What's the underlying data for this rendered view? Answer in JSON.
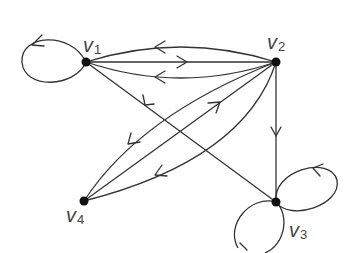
{
  "diagram": {
    "type": "directed multigraph",
    "nodes": [
      {
        "id": "v1",
        "label": "v",
        "subscript": "1"
      },
      {
        "id": "v2",
        "label": "v",
        "subscript": "2"
      },
      {
        "id": "v3",
        "label": "v",
        "subscript": "3"
      },
      {
        "id": "v4",
        "label": "v",
        "subscript": "4"
      }
    ],
    "edges": [
      {
        "id": "e1",
        "from": "v2",
        "to": "v1",
        "kind": "curve-upper"
      },
      {
        "id": "e2",
        "from": "v1",
        "to": "v2",
        "kind": "straight"
      },
      {
        "id": "e3",
        "from": "v2",
        "to": "v1",
        "kind": "curve-lower"
      },
      {
        "id": "e4",
        "from": "v1",
        "to": "v1",
        "kind": "loop"
      },
      {
        "id": "e5",
        "from": "v3",
        "to": "v1",
        "kind": "straight"
      },
      {
        "id": "e6",
        "from": "v2",
        "to": "v4",
        "kind": "curve-upper"
      },
      {
        "id": "e7",
        "from": "v4",
        "to": "v2",
        "kind": "straight"
      },
      {
        "id": "e8",
        "from": "v2",
        "to": "v4",
        "kind": "curve-lower"
      },
      {
        "id": "e9",
        "from": "v2",
        "to": "v3",
        "kind": "straight"
      },
      {
        "id": "e10",
        "from": "v3",
        "to": "v3",
        "kind": "loop"
      },
      {
        "id": "e11",
        "from": "v3",
        "to": "v3",
        "kind": "loop"
      }
    ],
    "stroke_color": "#333333",
    "node_color": "#111111",
    "label_color": "#444444"
  }
}
